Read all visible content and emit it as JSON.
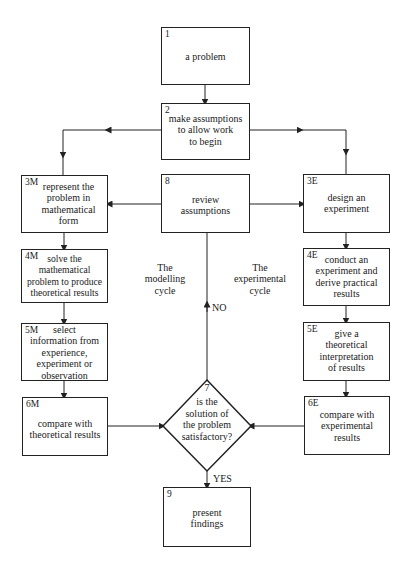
{
  "diagram": {
    "nodes": {
      "n1": {
        "id": "1",
        "text": "a problem"
      },
      "n2": {
        "id": "2",
        "text": "make assumptions\nto allow work\nto begin"
      },
      "n3M": {
        "id": "3M",
        "text": "represent the\nproblem in\nmathematical\nform"
      },
      "n8": {
        "id": "8",
        "text": "review\nassumptions"
      },
      "n3E": {
        "id": "3E",
        "text": "design an\nexperiment"
      },
      "n4M": {
        "id": "4M",
        "text": "solve the\nmathematical\nproblem to produce\ntheoretical results"
      },
      "n4E": {
        "id": "4E",
        "text": "conduct an\nexperiment and\nderive practical\nresults"
      },
      "n5M": {
        "id": "5M",
        "text": "select\ninformation from\nexperience,\nexperiment or\nobservation"
      },
      "n5E": {
        "id": "5E",
        "text": "give a\ntheoretical\ninterpretation\nof results"
      },
      "n6M": {
        "id": "6M",
        "text": "compare with\ntheoretical results"
      },
      "n6E": {
        "id": "6E",
        "text": "compare with\nexperimental\nresults"
      },
      "n7": {
        "id": "7",
        "text": "is the\nsolution of\nthe problem\nsatisfactory?"
      },
      "n9": {
        "id": "9",
        "text": "present\nfindings"
      }
    },
    "labels": {
      "modelling_cycle": "The\nmodelling\ncycle",
      "experimental_cycle": "The\nexperimental\ncycle",
      "no": "NO",
      "yes": "YES"
    },
    "edges": [
      {
        "from": "1",
        "to": "2"
      },
      {
        "from": "2",
        "to": "3M"
      },
      {
        "from": "2",
        "to": "3E"
      },
      {
        "from": "8",
        "to": "3M"
      },
      {
        "from": "8",
        "to": "3E"
      },
      {
        "from": "3M",
        "to": "4M"
      },
      {
        "from": "4M",
        "to": "5M"
      },
      {
        "from": "5M",
        "to": "6M"
      },
      {
        "from": "6M",
        "to": "7"
      },
      {
        "from": "3E",
        "to": "4E"
      },
      {
        "from": "4E",
        "to": "5E"
      },
      {
        "from": "5E",
        "to": "6E"
      },
      {
        "from": "6E",
        "to": "7"
      },
      {
        "from": "7",
        "to": "8",
        "label": "NO"
      },
      {
        "from": "7",
        "to": "9",
        "label": "YES"
      }
    ],
    "colors": {
      "line": "#222222",
      "background": "#ffffff"
    }
  }
}
